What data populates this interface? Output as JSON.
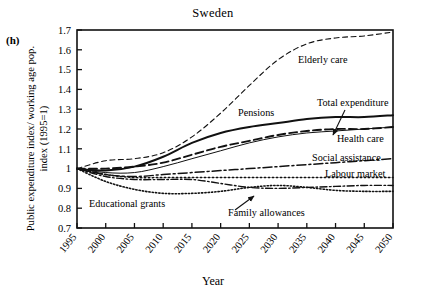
{
  "panel": {
    "label": "(h)"
  },
  "chart_data": {
    "type": "line",
    "title": "Sweden",
    "xlabel": "Year",
    "ylabel": "Public expenditure index/ working age pop. index (1995=1)",
    "xlim": [
      1995,
      2050
    ],
    "ylim": [
      0.7,
      1.7
    ],
    "grid": false,
    "legend_position": "inline-annotations",
    "x": [
      1995,
      2000,
      2005,
      2010,
      2015,
      2020,
      2025,
      2030,
      2035,
      2040,
      2045,
      2050
    ],
    "xticklabels": [
      "1995",
      "2000",
      "2005",
      "2010",
      "2015",
      "2020",
      "2025",
      "2030",
      "2035",
      "2040",
      "2045",
      "2050"
    ],
    "yticklabels": [
      "0.7",
      "0.8",
      "0.9",
      "1",
      "1.1",
      "1.2",
      "1.3",
      "1.4",
      "1.5",
      "1.6",
      "1.7"
    ],
    "yticks": [
      0.7,
      0.8,
      0.9,
      1.0,
      1.1,
      1.2,
      1.3,
      1.4,
      1.5,
      1.6,
      1.7
    ],
    "series": [
      {
        "name": "Elderly care",
        "style": "fine-dashed",
        "values": [
          1.0,
          1.04,
          1.05,
          1.08,
          1.16,
          1.28,
          1.42,
          1.55,
          1.63,
          1.66,
          1.67,
          1.69
        ]
      },
      {
        "name": "Pensions",
        "style": "thick-solid",
        "values": [
          1.0,
          0.99,
          1.01,
          1.06,
          1.13,
          1.18,
          1.21,
          1.23,
          1.25,
          1.26,
          1.26,
          1.27
        ]
      },
      {
        "name": "Total expenditure",
        "style": "thin-solid",
        "values": [
          1.0,
          0.98,
          0.98,
          1.01,
          1.05,
          1.09,
          1.13,
          1.16,
          1.18,
          1.19,
          1.2,
          1.21
        ]
      },
      {
        "name": "Health care",
        "style": "bold-dashed",
        "values": [
          1.0,
          1.0,
          1.01,
          1.03,
          1.07,
          1.11,
          1.14,
          1.17,
          1.19,
          1.2,
          1.2,
          1.21
        ]
      },
      {
        "name": "Social assistance",
        "style": "dash-dot",
        "values": [
          1.0,
          0.97,
          0.96,
          0.97,
          0.98,
          0.99,
          1.0,
          1.01,
          1.02,
          1.03,
          1.04,
          1.05
        ]
      },
      {
        "name": "Labour market",
        "style": "dotted",
        "values": [
          1.0,
          0.97,
          0.955,
          0.955,
          0.955,
          0.955,
          0.955,
          0.955,
          0.955,
          0.955,
          0.955,
          0.955
        ]
      },
      {
        "name": "Educational grants",
        "style": "dash-dot-fine",
        "values": [
          1.0,
          0.96,
          0.945,
          0.945,
          0.945,
          0.925,
          0.905,
          0.9,
          0.905,
          0.91,
          0.915,
          0.915
        ]
      },
      {
        "name": "Family allowances",
        "style": "fine-dotted",
        "values": [
          1.0,
          0.935,
          0.895,
          0.875,
          0.875,
          0.885,
          0.905,
          0.915,
          0.905,
          0.89,
          0.885,
          0.885
        ]
      }
    ],
    "annotations": [
      {
        "text": "Elderly care",
        "x": 298,
        "y": 63,
        "anchor": "start"
      },
      {
        "text": "Pensions",
        "x": 238,
        "y": 116,
        "anchor": "start"
      },
      {
        "text": "Total expenditure",
        "x": 317,
        "y": 106,
        "anchor": "start"
      },
      {
        "text": "Health care",
        "x": 337,
        "y": 142,
        "anchor": "start"
      },
      {
        "text": "Social assistance",
        "x": 312,
        "y": 161,
        "anchor": "start"
      },
      {
        "text": "Labour market",
        "x": 325,
        "y": 177,
        "anchor": "start"
      },
      {
        "text": "Educational grants",
        "x": 89,
        "y": 207,
        "anchor": "start"
      },
      {
        "text": "Family allowances",
        "x": 228,
        "y": 216,
        "anchor": "start"
      }
    ]
  }
}
